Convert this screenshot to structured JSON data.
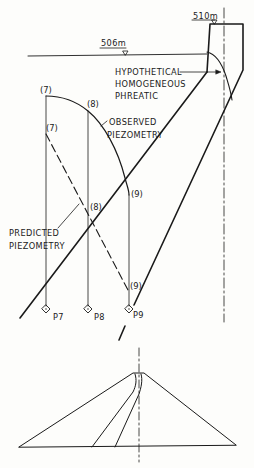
{
  "elevations": {
    "crest": "510m",
    "reservoir": "506m"
  },
  "labels": {
    "hypothetical_1": "HYPOTHETICAL",
    "hypothetical_2": "HOMOGENEOUS",
    "hypothetical_3": "PHREATIC",
    "observed_1": "OBSERVED",
    "observed_2": "PIEZOMETRY",
    "predicted_1": "PREDICTED",
    "predicted_2": "PIEZOMETRY"
  },
  "piezometers": [
    {
      "name": "P7",
      "observed_tag": "(7)",
      "predicted_tag": "(7)"
    },
    {
      "name": "P8",
      "observed_tag": "(8)",
      "predicted_tag": "(8)"
    },
    {
      "name": "P9",
      "observed_tag": "(9)",
      "predicted_tag": "(9)"
    }
  ],
  "colors": {
    "ink": "#1a1a1a",
    "paper": "#fdfdfb"
  }
}
